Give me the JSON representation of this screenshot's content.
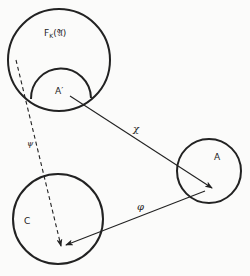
{
  "diagram": {
    "type": "category-mapping-diagram",
    "colors": {
      "stroke": "#222222",
      "background": "#fbfbfa"
    },
    "nodes": [
      {
        "id": "FK",
        "label_main": "F",
        "label_sub": "K",
        "label_arg": "(𝔄)",
        "shape": "circle",
        "cx": 59,
        "cy": 60,
        "r": 51
      },
      {
        "id": "A_prime",
        "label": "A′",
        "shape": "cap-inside-FK"
      },
      {
        "id": "A",
        "label": "A",
        "shape": "circle",
        "cx": 209,
        "cy": 171,
        "r": 32
      },
      {
        "id": "C",
        "label": "C",
        "shape": "circle",
        "cx": 58,
        "cy": 219,
        "r": 45
      }
    ],
    "edges": [
      {
        "id": "chi",
        "label": "χ",
        "from": "A_prime",
        "to": "A",
        "style": "solid",
        "arrow": "end"
      },
      {
        "id": "phi",
        "label": "φ",
        "from": "A",
        "to": "C",
        "style": "solid",
        "arrow": "end"
      },
      {
        "id": "psi",
        "label": "ψ",
        "from": "FK",
        "to": "C",
        "style": "dashed",
        "arrow": "end"
      }
    ]
  }
}
